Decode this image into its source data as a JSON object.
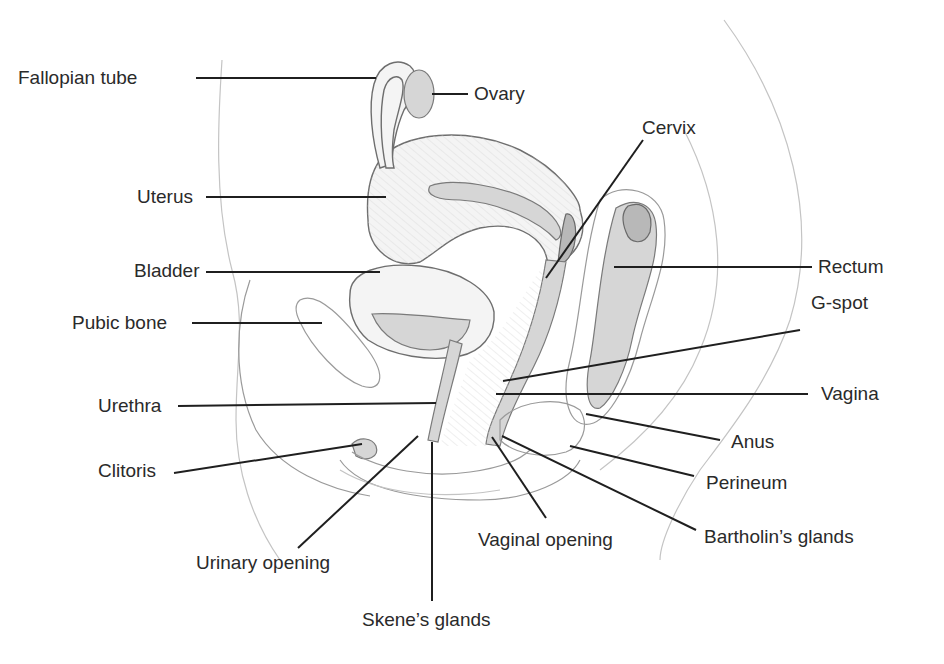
{
  "diagram": {
    "colors": {
      "ink": "#1f1f1f",
      "label_text": "#2a2a2a",
      "sketch": "#6e6e6e",
      "background": "#ffffff"
    },
    "labels": [
      {
        "id": "fallopian-tube",
        "text": "Fallopian tube",
        "x": 18,
        "y": 68,
        "line": [
          196,
          78,
          376,
          78
        ]
      },
      {
        "id": "ovary",
        "text": "Ovary",
        "x": 474,
        "y": 84,
        "line": [
          432,
          94,
          468,
          94
        ]
      },
      {
        "id": "uterus",
        "text": "Uterus",
        "x": 137,
        "y": 187,
        "line": [
          206,
          197,
          386,
          197
        ]
      },
      {
        "id": "bladder",
        "text": "Bladder",
        "x": 134,
        "y": 261,
        "line": [
          206,
          272,
          380,
          272
        ]
      },
      {
        "id": "pubic-bone",
        "text": "Pubic bone",
        "x": 72,
        "y": 313,
        "line": [
          192,
          323,
          322,
          323
        ]
      },
      {
        "id": "urethra",
        "text": "Urethra",
        "x": 98,
        "y": 396,
        "line": [
          178,
          406,
          436,
          403
        ]
      },
      {
        "id": "clitoris",
        "text": "Clitoris",
        "x": 98,
        "y": 461,
        "line": [
          174,
          473,
          362,
          444
        ]
      },
      {
        "id": "urinary-opening",
        "text": "Urinary opening",
        "x": 196,
        "y": 553,
        "line": [
          298,
          548,
          418,
          436
        ]
      },
      {
        "id": "skenes-glands",
        "text": "Skene’s glands",
        "x": 362,
        "y": 610,
        "line": [
          432,
          601,
          432,
          442
        ]
      },
      {
        "id": "vaginal-opening",
        "text": "Vaginal opening",
        "x": 478,
        "y": 530,
        "line": [
          546,
          518,
          492,
          437
        ]
      },
      {
        "id": "cervix",
        "text": "Cervix",
        "x": 642,
        "y": 118,
        "line": [
          643,
          140,
          546,
          278
        ]
      },
      {
        "id": "rectum",
        "text": "Rectum",
        "x": 818,
        "y": 257,
        "line": [
          614,
          267,
          812,
          267
        ]
      },
      {
        "id": "g-spot",
        "text": "G-spot",
        "x": 811,
        "y": 293,
        "line": [
          503,
          381,
          800,
          330
        ]
      },
      {
        "id": "vagina",
        "text": "Vagina",
        "x": 821,
        "y": 384,
        "line": [
          496,
          394,
          808,
          394
        ]
      },
      {
        "id": "anus",
        "text": "Anus",
        "x": 731,
        "y": 432,
        "line": [
          586,
          414,
          720,
          440
        ]
      },
      {
        "id": "perineum",
        "text": "Perineum",
        "x": 706,
        "y": 473,
        "line": [
          570,
          446,
          694,
          476
        ]
      },
      {
        "id": "bartholins-glands",
        "text": "Bartholin’s glands",
        "x": 704,
        "y": 527,
        "line": [
          502,
          436,
          696,
          530
        ]
      }
    ]
  }
}
